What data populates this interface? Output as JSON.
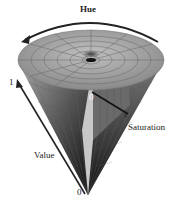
{
  "diagram": {
    "labels": {
      "hue": "Hue",
      "saturation": "Saturation",
      "value": "Value",
      "value_max": "1",
      "value_min": "0",
      "saturation_min": "0",
      "saturation_max": "1"
    },
    "colors": {
      "top_light": "#d8d8d8",
      "side_dark": "#111111",
      "grid": "#555555",
      "arrow": "#222222"
    }
  }
}
